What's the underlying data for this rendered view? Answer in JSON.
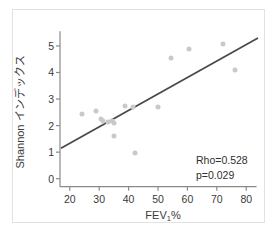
{
  "figure": {
    "background_color": "#ffffff",
    "frame_color": "#e2e2e2"
  },
  "chart_data": {
    "type": "scatter",
    "title": "",
    "xlabel": "FEV₁%",
    "xlabel_main": "FEV",
    "xlabel_sub": "1",
    "xlabel_suffix": "%",
    "ylabel": "Shannon インデックス",
    "xlim": [
      16,
      84
    ],
    "ylim": [
      -0.35,
      5.6
    ],
    "xticks": [
      20,
      30,
      40,
      50,
      60,
      70,
      80
    ],
    "xtick_labels": [
      "20",
      "30",
      "40",
      "50",
      "60",
      "70",
      "80"
    ],
    "yticks": [
      0,
      1,
      2,
      3,
      4,
      5
    ],
    "ytick_labels": [
      "0",
      "1",
      "2",
      "3",
      "4",
      "5"
    ],
    "grid": false,
    "legend": null,
    "marker_color": "#c9c9c9",
    "line_color": "#4a4a4a",
    "axis_color": "#8a8a8a",
    "points": [
      {
        "x": 24.2,
        "y": 2.43
      },
      {
        "x": 28.9,
        "y": 2.54
      },
      {
        "x": 30.6,
        "y": 2.25
      },
      {
        "x": 31.4,
        "y": 2.17
      },
      {
        "x": 33.0,
        "y": 2.12
      },
      {
        "x": 34.2,
        "y": 2.17
      },
      {
        "x": 35.0,
        "y": 2.1
      },
      {
        "x": 35.1,
        "y": 1.6
      },
      {
        "x": 38.9,
        "y": 2.74
      },
      {
        "x": 41.5,
        "y": 2.7
      },
      {
        "x": 42.1,
        "y": 0.97
      },
      {
        "x": 50.0,
        "y": 2.71
      },
      {
        "x": 54.3,
        "y": 4.55
      },
      {
        "x": 60.5,
        "y": 4.9
      },
      {
        "x": 72.0,
        "y": 5.08
      },
      {
        "x": 76.2,
        "y": 4.1
      }
    ],
    "fit_line": {
      "x0": 17.0,
      "y0": 1.15,
      "x1": 84.0,
      "y1": 5.3
    },
    "annotations": [
      {
        "id": "rho",
        "text": "Rho=0.528",
        "value": 0.528
      },
      {
        "id": "pvalue",
        "text": "p=0.029",
        "value": 0.029
      }
    ]
  }
}
